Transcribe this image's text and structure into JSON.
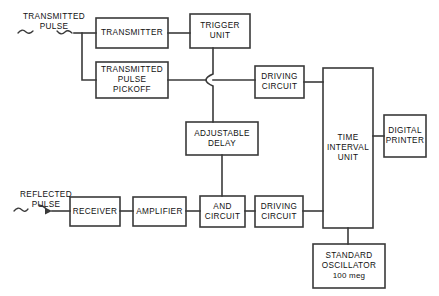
{
  "diagram": {
    "stroke_color": "#3a3a3a",
    "box_fill": "#ffffff",
    "text_color": "#111111",
    "blocks": [
      {
        "id": "transmitter",
        "label_lines": [
          "TRANSMITTER"
        ]
      },
      {
        "id": "trigger-unit",
        "label_lines": [
          "TRIGGER",
          "UNIT"
        ]
      },
      {
        "id": "transmitted-pulse-pickoff",
        "label_lines": [
          "TRANSMITTED",
          "PULSE",
          "PICKOFF"
        ]
      },
      {
        "id": "driving-circuit-top",
        "label_lines": [
          "DRIVING",
          "CIRCUIT"
        ]
      },
      {
        "id": "adjustable-delay",
        "label_lines": [
          "ADJUSTABLE",
          "DELAY"
        ]
      },
      {
        "id": "time-interval-unit",
        "label_lines": [
          "TIME",
          "INTERVAL",
          "UNIT"
        ]
      },
      {
        "id": "digital-printer",
        "label_lines": [
          "DIGITAL",
          "PRINTER"
        ]
      },
      {
        "id": "receiver",
        "label_lines": [
          "RECEIVER"
        ]
      },
      {
        "id": "amplifier",
        "label_lines": [
          "AMPLIFIER"
        ]
      },
      {
        "id": "and-circuit",
        "label_lines": [
          "AND",
          "CIRCUIT"
        ]
      },
      {
        "id": "driving-circuit-bottom",
        "label_lines": [
          "DRIVING",
          "CIRCUIT"
        ]
      },
      {
        "id": "standard-oscillator",
        "label_lines": [
          "STANDARD",
          "OSCILLATOR"
        ],
        "label_lowercase": "100 meg"
      }
    ],
    "io_labels": [
      {
        "id": "transmitted-pulse-input",
        "lines": [
          "TRANSMITTED",
          "PULSE"
        ]
      },
      {
        "id": "reflected-pulse-input",
        "lines": [
          "REFLECTED",
          "PULSE"
        ]
      }
    ]
  }
}
